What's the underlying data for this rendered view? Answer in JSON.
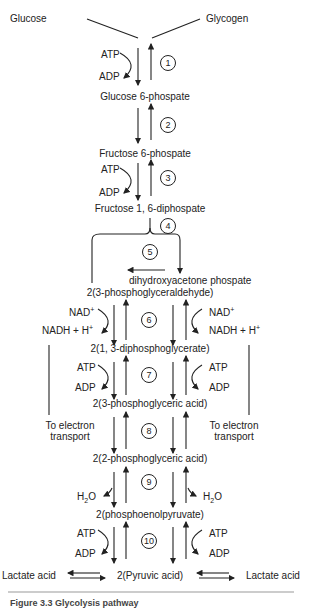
{
  "diagram": {
    "title": "Glycolysis pathway",
    "sources": {
      "left": "Glucose",
      "right": "Glycogen"
    },
    "compounds": {
      "g6p": "Glucose 6-phospate",
      "f6p": "Fructose 6-phospate",
      "f16dp": "Fructose 1, 6-diphospate",
      "dhap": "dihydroxyacetone phospate",
      "g3p": "2(3-phosphoglyceraldehyde)",
      "bpg": "2(1, 3-diphosphoglycerate)",
      "pga3": "2(3-phosphoglyceric acid)",
      "pga2": "2(2-phosphoglyceric acid)",
      "pep": "2(phosphoenolpyruvate)",
      "pyruvate": "2(Pyruvic acid)",
      "lactate_left": "Lactate acid",
      "lactate_right": "Lactate acid"
    },
    "cofactors": {
      "atp": "ATP",
      "adp": "ADP",
      "nad": "NAD",
      "nadh": "NADH + H",
      "plus": "+",
      "h2o_h": "H",
      "h2o_2": "2",
      "h2o_o": "O"
    },
    "side_notes": {
      "left": "To electron transport",
      "right": "To electron transport"
    },
    "steps": [
      "1",
      "2",
      "3",
      "4",
      "5",
      "6",
      "7",
      "8",
      "9",
      "10"
    ]
  },
  "caption": {
    "text": "Figure 3.3   Glycolysis pathway"
  },
  "colors": {
    "ink": "#222222",
    "rule": "#999999"
  }
}
